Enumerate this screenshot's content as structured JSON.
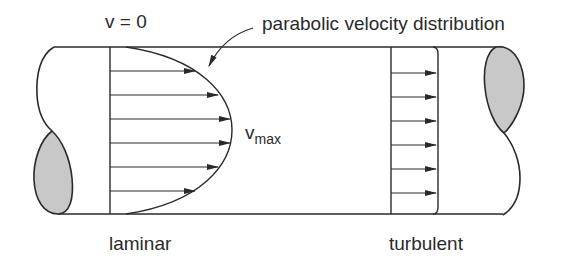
{
  "diagram": {
    "labels": {
      "wall_velocity": "v = 0",
      "profile_callout": "parabolic velocity distribution",
      "vmax_main": "v",
      "vmax_sub": "max",
      "laminar": "laminar",
      "turbulent": "turbulent"
    },
    "colors": {
      "line": "#2a2a2a",
      "section_fill": "#c8c8c8",
      "background": "#ffffff"
    },
    "laminar_profile": {
      "arrow_count": 6,
      "arrow_y": [
        71,
        95,
        119,
        143,
        167,
        191
      ],
      "arrow_tip_x": [
        195,
        218,
        230,
        230,
        218,
        195
      ]
    },
    "turbulent_profile": {
      "arrow_count": 6,
      "arrow_y": [
        73,
        97,
        121,
        145,
        169,
        193
      ],
      "arrow_tip_x": [
        435,
        435,
        435,
        435,
        435,
        435
      ]
    }
  }
}
